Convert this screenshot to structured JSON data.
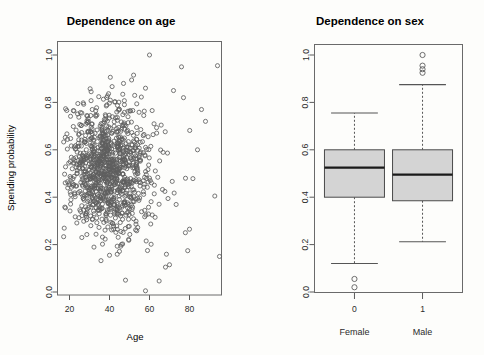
{
  "figure": {
    "background_color": "#fdfdfb",
    "axis_color": "#5a5a5a",
    "point_stroke_color": "#5e5e5e",
    "box_fill_color": "#d4d4d4",
    "box_line_color": "#4a4a4a",
    "median_color": "#1a1a1a"
  },
  "panels": [
    {
      "id": "age",
      "title": "Dependence on age",
      "xlabel": "Age",
      "ylabel": "Spending probability"
    },
    {
      "id": "sex",
      "title": "Dependence on sex",
      "xlabel": "",
      "ylabel": ""
    }
  ],
  "chart_data": [
    {
      "type": "scatter",
      "title": "Dependence on age",
      "xlabel": "Age",
      "ylabel": "Spending probability",
      "xlim": [
        14,
        96
      ],
      "ylim": [
        -0.02,
        1.02
      ],
      "xticks": [
        20,
        40,
        60,
        80
      ],
      "xtick_labels": [
        "20",
        "40",
        "60",
        "80"
      ],
      "yticks": [
        0.0,
        0.2,
        0.4,
        0.6,
        0.8,
        1.0
      ],
      "ytick_labels": [
        "0.0",
        "0.2",
        "0.4",
        "0.6",
        "0.8",
        "1.0"
      ],
      "grid": false,
      "legend": "none",
      "marker": "open-circle",
      "n_points": 1100,
      "point_cloud_description": "Dense cloud centred near age 38 and probability 0.52, right-skewed in age with a long sparse tail to age 95; probability spread roughly 0.2-0.8 with sparse outliers down to 0.0 and up to 1.0.",
      "cluster": {
        "x_mean": 38,
        "x_sd": 11,
        "y_mean": 0.52,
        "y_sd": 0.135,
        "x_min": 17,
        "x_max": 95,
        "y_min": 0.0,
        "y_max": 1.0
      },
      "notable_points": [
        {
          "x": 60,
          "y": 1.0
        },
        {
          "x": 76,
          "y": 0.95
        },
        {
          "x": 94,
          "y": 0.955
        },
        {
          "x": 47,
          "y": 0.88
        },
        {
          "x": 58,
          "y": 0.86
        },
        {
          "x": 72,
          "y": 0.85
        },
        {
          "x": 77,
          "y": 0.82
        },
        {
          "x": 86,
          "y": 0.77
        },
        {
          "x": 88,
          "y": 0.72
        },
        {
          "x": 84,
          "y": 0.6
        },
        {
          "x": 78,
          "y": 0.48
        },
        {
          "x": 18,
          "y": 0.355
        },
        {
          "x": 80,
          "y": 0.265
        },
        {
          "x": 95,
          "y": 0.15
        },
        {
          "x": 40,
          "y": 0.155
        },
        {
          "x": 59,
          "y": 0.175
        },
        {
          "x": 68,
          "y": 0.105
        },
        {
          "x": 70,
          "y": 0.115
        },
        {
          "x": 48,
          "y": 0.05
        },
        {
          "x": 58,
          "y": 0.005
        }
      ]
    },
    {
      "type": "boxplot",
      "title": "Dependence on sex",
      "xlabel": "",
      "ylabel": "",
      "ylim": [
        -0.02,
        1.02
      ],
      "yticks": [
        0.0,
        0.2,
        0.4,
        0.6,
        0.8,
        1.0
      ],
      "ytick_labels": [
        "0.0",
        "0.2",
        "0.4",
        "0.6",
        "0.8",
        "1.0"
      ],
      "xtick_labels": [
        "0",
        "1"
      ],
      "group_labels": [
        "Female",
        "Male"
      ],
      "grid": false,
      "legend": "none",
      "boxes": [
        {
          "name": "0",
          "group": "Female",
          "whisker_low": 0.12,
          "q1": 0.4,
          "median": 0.525,
          "q3": 0.6,
          "whisker_high": 0.755,
          "outliers": [
            0.055,
            0.02
          ]
        },
        {
          "name": "1",
          "group": "Male",
          "whisker_low": 0.212,
          "q1": 0.385,
          "median": 0.495,
          "q3": 0.6,
          "whisker_high": 0.875,
          "outliers": [
            1.0,
            0.955,
            0.94,
            0.925
          ]
        }
      ]
    }
  ]
}
